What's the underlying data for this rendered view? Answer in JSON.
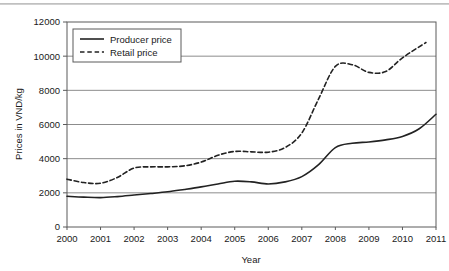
{
  "chart_data": {
    "type": "line",
    "title": "",
    "xlabel": "Year",
    "ylabel": "Prices in VND/kg",
    "xlim": [
      2000,
      2011
    ],
    "ylim": [
      0,
      12000
    ],
    "grid": true,
    "legend_position": "top-left",
    "x_tick_labels": [
      "2000",
      "2001",
      "2002",
      "2003",
      "2004",
      "2005",
      "2006",
      "2007",
      "2008",
      "2009",
      "2010",
      "2011"
    ],
    "y_tick_labels": [
      "0",
      "2000",
      "4000",
      "6000",
      "8000",
      "10000",
      "12000"
    ],
    "x_ticks": [
      2000,
      2001,
      2002,
      2003,
      2004,
      2005,
      2006,
      2007,
      2008,
      2009,
      2010,
      2011
    ],
    "y_ticks": [
      0,
      2000,
      4000,
      6000,
      8000,
      10000,
      12000
    ],
    "series": [
      {
        "name": "Producer price",
        "style": "solid",
        "color": "#222222",
        "x": [
          2000,
          2000.5,
          2001,
          2001.5,
          2002,
          2002.5,
          2003,
          2003.5,
          2004,
          2004.5,
          2005,
          2005.5,
          2006,
          2006.5,
          2007,
          2007.5,
          2008,
          2008.5,
          2009,
          2009.5,
          2010,
          2010.5,
          2011
        ],
        "values": [
          1800,
          1750,
          1720,
          1780,
          1870,
          1960,
          2060,
          2200,
          2350,
          2520,
          2680,
          2640,
          2520,
          2640,
          2950,
          3650,
          4650,
          4900,
          4980,
          5100,
          5300,
          5750,
          6600
        ]
      },
      {
        "name": "Retail price",
        "style": "dashed",
        "color": "#222222",
        "x": [
          2000,
          2000.5,
          2001,
          2001.5,
          2002,
          2002.5,
          2003,
          2003.5,
          2004,
          2004.5,
          2005,
          2005.5,
          2006,
          2006.5,
          2007,
          2007.5,
          2008,
          2008.5,
          2009,
          2009.5,
          2010,
          2010.7
        ],
        "values": [
          2800,
          2600,
          2560,
          2900,
          3450,
          3520,
          3520,
          3580,
          3800,
          4200,
          4420,
          4400,
          4380,
          4650,
          5500,
          7500,
          9400,
          9500,
          9050,
          9100,
          9900,
          10800
        ]
      }
    ]
  },
  "legend": {
    "items": [
      {
        "label": "Producer price",
        "style": "solid"
      },
      {
        "label": "Retail price",
        "style": "dashed"
      }
    ]
  },
  "axes": {
    "x_title": "Year",
    "y_title": "Prices in VND/kg"
  }
}
